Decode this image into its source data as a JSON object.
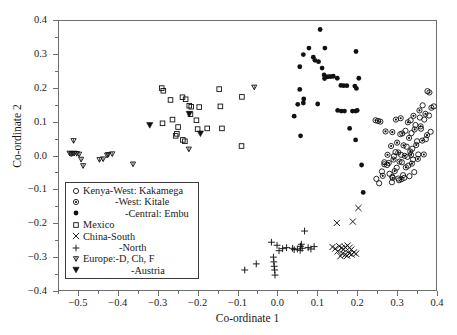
{
  "chart_data": {
    "type": "scatter",
    "title": "",
    "xlabel": "Co-ordinate 1",
    "ylabel": "Co-ordinate 2",
    "xlim": [
      -0.55,
      0.4
    ],
    "ylim": [
      -0.4,
      0.4
    ],
    "xticks": [
      -0.5,
      -0.4,
      -0.3,
      -0.2,
      -0.1,
      0.0,
      0.1,
      0.2,
      0.3,
      0.4
    ],
    "xtick_labels": [
      "−0.5",
      "−0.4",
      "−0.3",
      "−0.2",
      "−0.1",
      "0.0",
      "0.1",
      "0.2",
      "0.3",
      "0.4"
    ],
    "yticks": [
      -0.4,
      -0.3,
      -0.2,
      -0.1,
      0.0,
      0.1,
      0.2,
      0.3,
      0.4
    ],
    "ytick_labels": [
      "−0.4",
      "−0.3",
      "−0.2",
      "−0.1",
      "0.0",
      "0.1",
      "0.2",
      "0.3",
      "0.4"
    ],
    "grid": false,
    "legend_position": "lower-left-inside",
    "series": [
      {
        "name": "Kenya-West: Kakamega",
        "marker": "open-circle",
        "color": "#111111",
        "points": [
          [
            0.248,
            -0.069
          ],
          [
            0.262,
            -0.047
          ],
          [
            0.268,
            -0.02
          ],
          [
            0.275,
            -0.028
          ],
          [
            0.281,
            -0.054
          ],
          [
            0.288,
            -0.063
          ],
          [
            0.292,
            -0.002
          ],
          [
            0.296,
            0.01
          ],
          [
            0.299,
            -0.036
          ],
          [
            0.303,
            -0.068
          ],
          [
            0.308,
            0.063
          ],
          [
            0.31,
            0.002
          ],
          [
            0.312,
            -0.02
          ],
          [
            0.315,
            -0.058
          ],
          [
            0.318,
            -0.066
          ],
          [
            0.321,
            0.073
          ],
          [
            0.324,
            0.026
          ],
          [
            0.326,
            -0.004
          ],
          [
            0.328,
            -0.03
          ],
          [
            0.331,
            -0.061
          ],
          [
            0.334,
            0.104
          ],
          [
            0.336,
            0.066
          ],
          [
            0.338,
            0.02
          ],
          [
            0.34,
            -0.012
          ],
          [
            0.343,
            -0.049
          ],
          [
            0.346,
            0.09
          ],
          [
            0.35,
            0.042
          ],
          [
            0.353,
            0.003
          ],
          [
            0.357,
            0.112
          ],
          [
            0.36,
            0.079
          ],
          [
            0.364,
            0.148
          ],
          [
            0.368,
            0.106
          ],
          [
            0.372,
            0.048
          ],
          [
            0.376,
            0.19
          ],
          [
            0.38,
            0.118
          ],
          [
            0.384,
            0.07
          ],
          [
            0.392,
            0.145
          ],
          [
            0.255,
            -0.082
          ],
          [
            0.287,
            -0.079
          ],
          [
            0.305,
            -0.073
          ]
        ]
      },
      {
        "name": "-West: Kitale",
        "marker": "dot-circle",
        "color": "#111111",
        "points": [
          [
            0.246,
            0.104
          ],
          [
            0.252,
            0.102
          ],
          [
            0.268,
            -0.026
          ],
          [
            0.271,
            0.071
          ],
          [
            0.276,
            0.002
          ],
          [
            0.279,
            -0.022
          ],
          [
            0.285,
            0.028
          ],
          [
            0.288,
            0.069
          ],
          [
            0.291,
            -0.012
          ],
          [
            0.294,
            -0.046
          ],
          [
            0.297,
            0.106
          ],
          [
            0.3,
            0.038
          ],
          [
            0.303,
            0.009
          ],
          [
            0.306,
            -0.018
          ],
          [
            0.309,
            0.11
          ],
          [
            0.313,
            0.065
          ],
          [
            0.316,
            0.03
          ],
          [
            0.319,
            -0.001
          ],
          [
            0.322,
            -0.035
          ],
          [
            0.327,
            0.098
          ],
          [
            0.33,
            0.052
          ],
          [
            0.333,
            0.012
          ],
          [
            0.337,
            -0.024
          ],
          [
            0.341,
            0.117
          ],
          [
            0.344,
            0.077
          ],
          [
            0.348,
            0.031
          ],
          [
            0.352,
            -0.01
          ],
          [
            0.356,
            0.133
          ],
          [
            0.359,
            0.086
          ],
          [
            0.363,
            0.044
          ],
          [
            0.367,
            0.003
          ],
          [
            0.371,
            0.123
          ],
          [
            0.375,
            0.06
          ],
          [
            0.381,
            0.186
          ],
          [
            0.386,
            0.141
          ],
          [
            0.258,
            0.1
          ],
          [
            0.264,
            -0.06
          ],
          [
            0.289,
            -0.066
          ],
          [
            0.311,
            -0.07
          ],
          [
            0.335,
            0.002
          ]
        ]
      },
      {
        "name": "-Central: Embu",
        "marker": "filled-circle",
        "color": "#111111",
        "points": [
          [
            0.107,
            0.372
          ],
          [
            0.079,
            0.317
          ],
          [
            0.119,
            0.317
          ],
          [
            0.197,
            0.307
          ],
          [
            0.065,
            0.298
          ],
          [
            0.09,
            0.29
          ],
          [
            0.094,
            0.281
          ],
          [
            0.103,
            0.277
          ],
          [
            0.056,
            0.262
          ],
          [
            0.112,
            0.258
          ],
          [
            0.117,
            0.238
          ],
          [
            0.124,
            0.232
          ],
          [
            0.129,
            0.233
          ],
          [
            0.134,
            0.233
          ],
          [
            0.14,
            0.234
          ],
          [
            0.118,
            0.227
          ],
          [
            0.15,
            0.228
          ],
          [
            0.159,
            0.207
          ],
          [
            0.166,
            0.206
          ],
          [
            0.174,
            0.206
          ],
          [
            0.194,
            0.205
          ],
          [
            0.198,
            0.198
          ],
          [
            0.204,
            0.228
          ],
          [
            0.056,
            0.195
          ],
          [
            0.066,
            0.167
          ],
          [
            0.051,
            0.151
          ],
          [
            0.065,
            0.155
          ],
          [
            0.101,
            0.152
          ],
          [
            0.151,
            0.133
          ],
          [
            0.16,
            0.131
          ],
          [
            0.168,
            0.131
          ],
          [
            0.188,
            0.131
          ],
          [
            0.196,
            0.131
          ],
          [
            0.2,
            0.133
          ],
          [
            0.042,
            0.116
          ],
          [
            0.181,
            0.08
          ],
          [
            0.196,
            0.046
          ],
          [
            0.058,
            0.058
          ],
          [
            0.211,
            -0.028
          ],
          [
            0.215,
            -0.109
          ]
        ]
      },
      {
        "name": "Mexico",
        "marker": "open-square",
        "color": "#111111",
        "points": [
          [
            -0.29,
            0.199
          ],
          [
            -0.286,
            0.191
          ],
          [
            -0.268,
            0.164
          ],
          [
            -0.238,
            0.172
          ],
          [
            -0.23,
            0.166
          ],
          [
            -0.221,
            0.147
          ],
          [
            -0.216,
            0.144
          ],
          [
            -0.196,
            0.143
          ],
          [
            -0.146,
            0.196
          ],
          [
            -0.143,
            0.145
          ],
          [
            -0.288,
            0.095
          ],
          [
            -0.263,
            0.106
          ],
          [
            -0.249,
            0.084
          ],
          [
            -0.252,
            0.064
          ],
          [
            -0.255,
            0.058
          ],
          [
            -0.203,
            0.104
          ],
          [
            -0.2,
            0.078
          ],
          [
            -0.237,
            0.046
          ],
          [
            -0.232,
            0.042
          ],
          [
            -0.176,
            0.08
          ],
          [
            -0.139,
            0.08
          ],
          [
            -0.089,
            0.173
          ],
          [
            -0.09,
            0.028
          ],
          [
            -0.218,
            0.122
          ]
        ]
      },
      {
        "name": "China-South",
        "marker": "cross-x",
        "color": "#111111",
        "points": [
          [
            0.203,
            -0.155
          ],
          [
            0.149,
            -0.199
          ],
          [
            0.189,
            -0.195
          ],
          [
            0.155,
            -0.268
          ],
          [
            0.161,
            -0.273
          ],
          [
            0.166,
            -0.277
          ],
          [
            0.17,
            -0.271
          ],
          [
            0.176,
            -0.266
          ],
          [
            0.181,
            -0.272
          ],
          [
            0.185,
            -0.278
          ],
          [
            0.163,
            -0.29
          ],
          [
            0.17,
            -0.293
          ],
          [
            0.175,
            -0.296
          ],
          [
            0.18,
            -0.289
          ],
          [
            0.186,
            -0.292
          ],
          [
            0.192,
            -0.286
          ],
          [
            0.197,
            -0.29
          ],
          [
            0.145,
            -0.275
          ],
          [
            0.151,
            -0.283
          ],
          [
            0.158,
            -0.297
          ],
          [
            0.138,
            -0.27
          ]
        ]
      },
      {
        "name": "-North",
        "marker": "plus",
        "color": "#111111",
        "points": [
          [
            -0.082,
            -0.338
          ],
          [
            -0.053,
            -0.32
          ],
          [
            -0.015,
            -0.256
          ],
          [
            -0.001,
            -0.265
          ],
          [
            0.004,
            -0.281
          ],
          [
            -0.01,
            -0.3
          ],
          [
            -0.009,
            -0.314
          ],
          [
            -0.008,
            -0.327
          ],
          [
            -0.007,
            -0.338
          ],
          [
            -0.006,
            -0.353
          ],
          [
            0.013,
            -0.275
          ],
          [
            0.023,
            -0.272
          ],
          [
            0.038,
            -0.274
          ],
          [
            0.058,
            -0.268
          ],
          [
            0.062,
            -0.274
          ],
          [
            0.057,
            -0.28
          ],
          [
            0.06,
            -0.262
          ],
          [
            0.068,
            -0.223
          ],
          [
            0.077,
            -0.272
          ],
          [
            0.092,
            -0.269
          ],
          [
            0.084,
            -0.276
          ],
          [
            0.042,
            -0.278
          ],
          [
            0.05,
            -0.276
          ]
        ]
      },
      {
        "name": "Europe:-D, Ch, F",
        "marker": "open-triangle-down",
        "color": "#111111",
        "points": [
          [
            -0.511,
            0.043
          ],
          [
            -0.521,
            0.006
          ],
          [
            -0.517,
            0.004
          ],
          [
            -0.513,
            0.005
          ],
          [
            -0.509,
            0.006
          ],
          [
            -0.503,
            0.005
          ],
          [
            -0.497,
            0.003
          ],
          [
            -0.492,
            -0.012
          ],
          [
            -0.487,
            -0.031
          ],
          [
            -0.446,
            -0.013
          ],
          [
            -0.437,
            -0.011
          ],
          [
            -0.424,
            0.002
          ],
          [
            -0.414,
            0.004
          ],
          [
            -0.362,
            -0.026
          ],
          [
            -0.427,
            0.0
          ],
          [
            -0.222,
            0.018
          ],
          [
            -0.058,
            0.201
          ]
        ]
      },
      {
        "name": "-Austria",
        "marker": "filled-triangle-down",
        "color": "#111111",
        "points": [
          [
            -0.32,
            0.089
          ],
          [
            -0.221,
            0.122
          ],
          [
            -0.193,
            0.064
          ]
        ]
      }
    ]
  },
  "axes": {
    "x_label": "Co-ordinate 1",
    "y_label": "Co-ordinate 2"
  },
  "legend": {
    "entries": [
      {
        "marker": "open-circle",
        "label": "Kenya-West: Kakamega",
        "indent": "lt-right"
      },
      {
        "marker": "dot-circle",
        "label": "-West: Kitale",
        "indent": "lt-ind1"
      },
      {
        "marker": "filled-circle",
        "label": "-Central: Embu",
        "indent": "lt-ind2"
      },
      {
        "marker": "open-square",
        "label": "Mexico",
        "indent": "lt-right"
      },
      {
        "marker": "cross-x",
        "label": "China-South",
        "indent": "lt-right"
      },
      {
        "marker": "plus",
        "label": "-North",
        "indent": "lt-ind3"
      },
      {
        "marker": "open-triangle-down",
        "label": "Europe:-D, Ch, F",
        "indent": "lt-right"
      },
      {
        "marker": "filled-triangle-down",
        "label": "-Austria",
        "indent": "lt-ind4"
      }
    ]
  }
}
